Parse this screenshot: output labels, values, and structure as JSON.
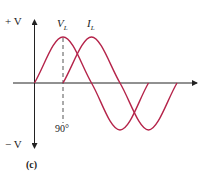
{
  "figure": {
    "panel_label": "(c)",
    "y_axis": {
      "top_label": "+ V",
      "bottom_label": "− V"
    },
    "phase_label": "90°",
    "curves": [
      {
        "name": "V",
        "subscript": "L",
        "color": "#b5244a",
        "phase_lead_deg": 90
      },
      {
        "name": "I",
        "subscript": "L",
        "color": "#b5244a",
        "phase_lead_deg": 0
      }
    ],
    "colors": {
      "axis": "#222222",
      "curve": "#b5244a",
      "dashed": "#555555"
    }
  }
}
